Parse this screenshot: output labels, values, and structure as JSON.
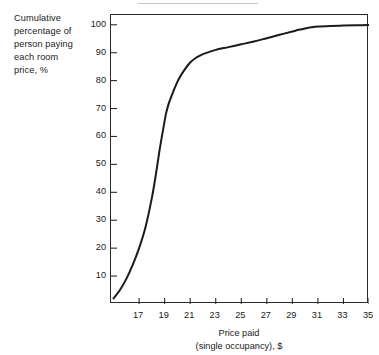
{
  "chart_data": {
    "type": "line",
    "title": "",
    "xlabel_lines": [
      "Price paid",
      "(single occupancy), $"
    ],
    "ylabel_lines": [
      "Cumulative",
      "percentage of",
      "person paying",
      "each room",
      "price, %"
    ],
    "xlabel": "Price paid (single occupancy), $",
    "ylabel": "Cumulative percentage of person paying each room price, %",
    "xlim": [
      14.8,
      35.0
    ],
    "ylim": [
      0,
      103.5
    ],
    "xticks": [
      17,
      19,
      21,
      23,
      25,
      27,
      29,
      31,
      33,
      35
    ],
    "xtick_labels": [
      "17",
      "19",
      "21",
      "23",
      "25",
      "27",
      "29",
      "31",
      "33",
      "35"
    ],
    "yticks": [
      10,
      20,
      30,
      40,
      50,
      60,
      70,
      80,
      90,
      100
    ],
    "ytick_labels": [
      "10",
      "20",
      "30",
      "40",
      "50",
      "60",
      "70",
      "80",
      "90",
      "100"
    ],
    "grid": false,
    "legend": false,
    "legend_position": "none",
    "line_color": "#1a1a1a",
    "line_width": 2.0,
    "series": [
      {
        "name": "Cumulative percentage of persons paying each room price",
        "x": [
          15.0,
          15.5,
          16.0,
          16.5,
          17.0,
          17.5,
          18.0,
          18.3,
          18.6,
          18.9,
          19.1,
          19.3,
          19.5,
          19.8,
          20.1,
          20.5,
          21.0,
          21.5,
          22.0,
          22.5,
          23.0,
          24.0,
          25.0,
          26.0,
          27.0,
          28.0,
          29.0,
          29.5,
          30.0,
          30.5,
          31.0,
          32.0,
          33.0,
          34.0,
          35.0
        ],
        "y": [
          2.0,
          5.0,
          9.0,
          14.0,
          20.0,
          27.5,
          38.0,
          46.0,
          55.0,
          63.0,
          68.0,
          71.5,
          74.0,
          77.5,
          80.5,
          83.5,
          86.5,
          88.3,
          89.5,
          90.3,
          91.0,
          92.0,
          93.0,
          94.0,
          95.2,
          96.4,
          97.6,
          98.2,
          98.7,
          99.1,
          99.4,
          99.6,
          99.7,
          99.8,
          99.9
        ]
      }
    ]
  },
  "ylabel": {
    "line1": "Cumulative",
    "line2": "percentage of",
    "line3": "person paying",
    "line4": "each room",
    "line5": "price, %"
  },
  "xlabel": {
    "line1": "Price paid",
    "line2": "(single occupancy), $"
  }
}
